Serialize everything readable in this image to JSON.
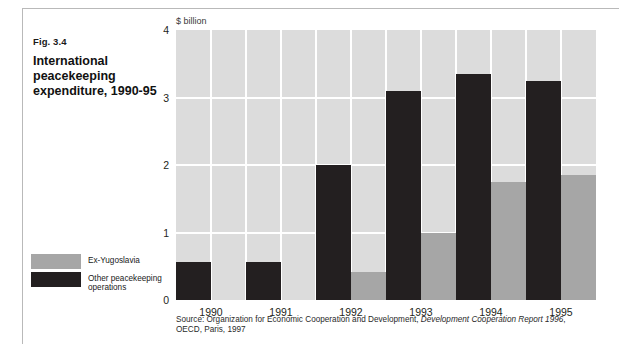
{
  "figure": {
    "number": "Fig. 3.4",
    "title": "International peacekeeping expenditure, 1990-95"
  },
  "legend": {
    "position": "bottom-left",
    "items": [
      {
        "label": "Ex-Yugoslavia",
        "color": "#a6a6a6",
        "swatch_name": "legend-swatch-ex-yugoslavia"
      },
      {
        "label": "Other peacekeeping operations",
        "color": "#231f20",
        "swatch_name": "legend-swatch-other-peacekeeping"
      }
    ]
  },
  "source": {
    "prefix": "Source:  Organization for Economic Cooperation and Development, ",
    "italic": "Development Cooperation Report 1996",
    "suffix": ",",
    "line2": "OECD, Paris, 1997"
  },
  "chart_data": {
    "type": "bar",
    "title": "International peacekeeping expenditure, 1990-95",
    "subtitle": "Fig. 3.4",
    "xlabel": "",
    "ylabel": "$ billion",
    "ylim": [
      0,
      4
    ],
    "yticks": [
      0,
      1,
      2,
      3,
      4
    ],
    "ytick_labels": [
      "0",
      "1",
      "2",
      "3",
      "4"
    ],
    "grid": true,
    "grid_color": "#ffffff",
    "plot_background": "#dcdcdc",
    "legend_position": "outside-bottom-left",
    "categories": [
      "1990",
      "1991",
      "1992",
      "1993",
      "1994",
      "1995"
    ],
    "series": [
      {
        "name": "Other peacekeeping operations",
        "color": "#231f20",
        "values": [
          0.57,
          0.56,
          2.0,
          3.1,
          3.35,
          3.25
        ]
      },
      {
        "name": "Ex-Yugoslavia",
        "color": "#a6a6a6",
        "values": [
          0,
          0,
          0.42,
          1.0,
          1.75,
          1.85
        ]
      }
    ]
  }
}
